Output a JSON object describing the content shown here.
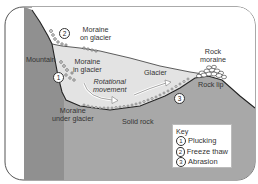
{
  "diagram": {
    "colors": {
      "rock": "#a6a6a6",
      "mountain": "#8f8f8f",
      "glacier": "#e4e4e4",
      "sky": "#ffffff",
      "frame": "#555555",
      "outline": "#222222"
    },
    "labels": {
      "mountain": "Mountain",
      "moraine_on_glacier_1": "Moraine",
      "moraine_on_glacier_2": "on glacier",
      "moraine_in_glacier_1": "Moraine",
      "moraine_in_glacier_2": "in glacier",
      "rotational_1": "Rotational",
      "rotational_2": "movement",
      "glacier": "Glacier",
      "rock_moraine_1": "Rock",
      "rock_moraine_2": "moraine",
      "rock_lip": "Rock lip",
      "moraine_under_1": "Moraine",
      "moraine_under_2": "under glacier",
      "solid_rock": "Solid rock"
    },
    "markers": {
      "m1": "1",
      "m2": "2",
      "m3": "3"
    },
    "key": {
      "title": "Key",
      "items": [
        {
          "num": "1",
          "label": "Plucking"
        },
        {
          "num": "2",
          "label": "Freeze thaw"
        },
        {
          "num": "3",
          "label": "Abrasion"
        }
      ]
    }
  }
}
